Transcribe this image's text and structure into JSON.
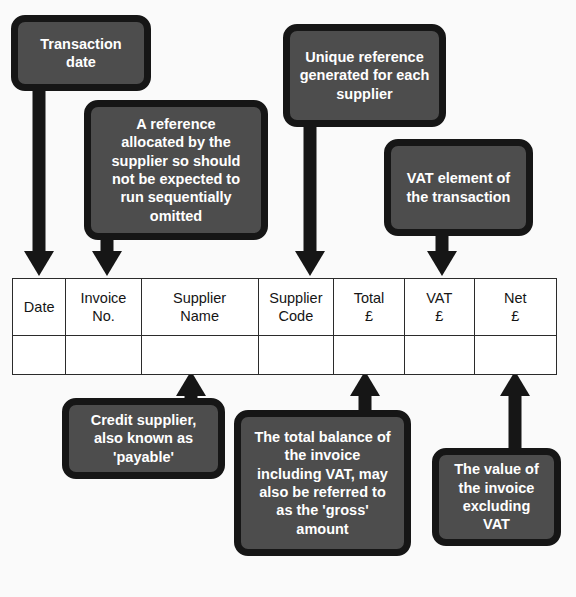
{
  "diagram": {
    "colors": {
      "background": "#fafafa",
      "callout_fill": "#4d4d4d",
      "callout_border": "#161616",
      "callout_text": "#ffffff",
      "table_line": "#2b2b2b",
      "table_text": "#151515"
    }
  },
  "callouts": {
    "transaction_date": "Transaction\ndate",
    "invoice_reference": "A reference\nallocated by the\nsupplier so should\nnot be expected to\nrun sequentially\nomitted",
    "supplier_code": "Unique reference\ngenerated for each\nsupplier",
    "vat_element": "VAT element of\nthe transaction",
    "credit_supplier": "Credit supplier,\nalso known as\n'payable'",
    "total_balance": "The total balance of\nthe invoice\nincluding VAT, may\nalso be referred to\nas the 'gross'\namount",
    "net_value": "The value of\nthe invoice\nexcluding\nVAT"
  },
  "table": {
    "headers": [
      "Date",
      "Invoice\nNo.",
      "Supplier\nName",
      "Supplier\nCode",
      "Total\n£",
      "VAT\n£",
      "Net\n£"
    ],
    "rows": [
      [
        "",
        "",
        "",
        "",
        "",
        "",
        ""
      ]
    ]
  }
}
